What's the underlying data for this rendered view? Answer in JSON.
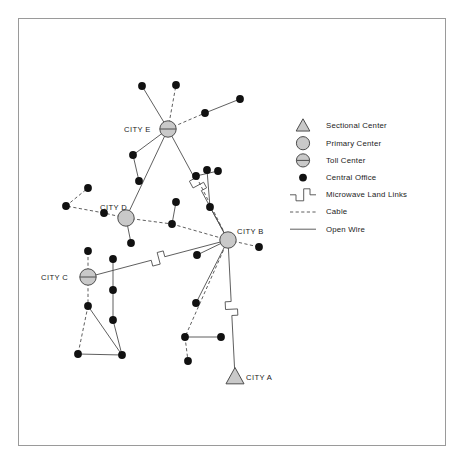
{
  "diagram": {
    "colors": {
      "line": "#4d4d4d",
      "node_fill": "#111111",
      "center_fill": "#c9c9c9",
      "center_stroke": "#4d4d4d",
      "frame": "#9a9a9a",
      "text": "#1a1a1a"
    },
    "cities": [
      {
        "id": "A",
        "label": "CITY A",
        "type": "sectional-center",
        "x": 235,
        "y": 377,
        "label_x": 246,
        "label_y": 373
      },
      {
        "id": "B",
        "label": "CITY B",
        "type": "primary-center",
        "x": 228,
        "y": 240,
        "label_x": 237,
        "label_y": 227
      },
      {
        "id": "C",
        "label": "CITY C",
        "type": "toll-center",
        "x": 88,
        "y": 277,
        "label_x": 41,
        "label_y": 273
      },
      {
        "id": "D",
        "label": "CITY D",
        "type": "primary-center",
        "x": 126,
        "y": 218,
        "label_x": 100,
        "label_y": 203
      },
      {
        "id": "E",
        "label": "CITY E",
        "type": "toll-center",
        "x": 168,
        "y": 129,
        "label_x": 124,
        "label_y": 125
      }
    ],
    "central_offices": [
      {
        "x": 142,
        "y": 86
      },
      {
        "x": 176,
        "y": 85
      },
      {
        "x": 240,
        "y": 99
      },
      {
        "x": 205,
        "y": 113
      },
      {
        "x": 133,
        "y": 155
      },
      {
        "x": 139,
        "y": 181
      },
      {
        "x": 88,
        "y": 188
      },
      {
        "x": 66,
        "y": 206
      },
      {
        "x": 104,
        "y": 213
      },
      {
        "x": 176,
        "y": 202
      },
      {
        "x": 172,
        "y": 224
      },
      {
        "x": 210,
        "y": 207
      },
      {
        "x": 196,
        "y": 176
      },
      {
        "x": 207,
        "y": 170
      },
      {
        "x": 218,
        "y": 171
      },
      {
        "x": 131,
        "y": 243
      },
      {
        "x": 88,
        "y": 251
      },
      {
        "x": 88,
        "y": 306
      },
      {
        "x": 78,
        "y": 354
      },
      {
        "x": 122,
        "y": 355
      },
      {
        "x": 113,
        "y": 259
      },
      {
        "x": 113,
        "y": 290
      },
      {
        "x": 113,
        "y": 320
      },
      {
        "x": 196,
        "y": 303
      },
      {
        "x": 185,
        "y": 337
      },
      {
        "x": 221,
        "y": 337
      },
      {
        "x": 188,
        "y": 361
      },
      {
        "x": 259,
        "y": 247
      },
      {
        "x": 197,
        "y": 255
      }
    ],
    "links": [
      {
        "from": "E",
        "to": "co",
        "kind": "open-wire",
        "x1": 168,
        "y1": 129,
        "x2": 142,
        "y2": 86
      },
      {
        "from": "E",
        "to": "co",
        "kind": "cable",
        "x1": 168,
        "y1": 129,
        "x2": 176,
        "y2": 85
      },
      {
        "from": "E",
        "to": "co",
        "kind": "cable",
        "x1": 168,
        "y1": 129,
        "x2": 205,
        "y2": 113
      },
      {
        "from": "co",
        "to": "co",
        "kind": "open-wire",
        "x1": 205,
        "y1": 113,
        "x2": 240,
        "y2": 99
      },
      {
        "from": "E",
        "to": "co",
        "kind": "open-wire",
        "x1": 168,
        "y1": 129,
        "x2": 133,
        "y2": 155
      },
      {
        "from": "co",
        "to": "co",
        "kind": "open-wire",
        "x1": 133,
        "y1": 155,
        "x2": 139,
        "y2": 181
      },
      {
        "from": "E",
        "to": "B",
        "kind": "microwave",
        "x1": 168,
        "y1": 129,
        "x2": 228,
        "y2": 240
      },
      {
        "from": "D",
        "to": "co",
        "kind": "cable",
        "x1": 126,
        "y1": 218,
        "x2": 104,
        "y2": 213
      },
      {
        "from": "co",
        "to": "co",
        "kind": "cable",
        "x1": 104,
        "y1": 213,
        "x2": 66,
        "y2": 206
      },
      {
        "from": "co",
        "to": "co",
        "kind": "cable",
        "x1": 66,
        "y1": 206,
        "x2": 88,
        "y2": 188
      },
      {
        "from": "D",
        "to": "co",
        "kind": "cable",
        "x1": 126,
        "y1": 218,
        "x2": 172,
        "y2": 224
      },
      {
        "from": "co",
        "to": "co",
        "kind": "open-wire",
        "x1": 172,
        "y1": 224,
        "x2": 176,
        "y2": 202
      },
      {
        "from": "co",
        "to": "B",
        "kind": "cable",
        "x1": 172,
        "y1": 224,
        "x2": 228,
        "y2": 240
      },
      {
        "from": "D",
        "to": "co",
        "kind": "open-wire",
        "x1": 126,
        "y1": 218,
        "x2": 131,
        "y2": 243
      },
      {
        "from": "D",
        "to": "E",
        "kind": "open-wire",
        "x1": 126,
        "y1": 218,
        "x2": 168,
        "y2": 129
      },
      {
        "from": "C",
        "to": "co",
        "kind": "cable",
        "x1": 88,
        "y1": 277,
        "x2": 88,
        "y2": 251
      },
      {
        "from": "C",
        "to": "co",
        "kind": "cable",
        "x1": 88,
        "y1": 277,
        "x2": 88,
        "y2": 306
      },
      {
        "from": "C",
        "to": "B",
        "kind": "microwave",
        "x1": 88,
        "y1": 277,
        "x2": 228,
        "y2": 240
      },
      {
        "from": "co",
        "to": "co",
        "kind": "open-wire",
        "x1": 88,
        "y1": 306,
        "x2": 122,
        "y2": 355
      },
      {
        "from": "co",
        "to": "co",
        "kind": "cable",
        "x1": 88,
        "y1": 306,
        "x2": 78,
        "y2": 354
      },
      {
        "from": "co",
        "to": "co",
        "kind": "open-wire",
        "x1": 78,
        "y1": 354,
        "x2": 122,
        "y2": 355
      },
      {
        "from": "co",
        "to": "co",
        "kind": "open-wire",
        "x1": 113,
        "y1": 259,
        "x2": 113,
        "y2": 290
      },
      {
        "from": "co",
        "to": "co",
        "kind": "open-wire",
        "x1": 113,
        "y1": 290,
        "x2": 113,
        "y2": 320
      },
      {
        "from": "co",
        "to": "co",
        "kind": "open-wire",
        "x1": 113,
        "y1": 320,
        "x2": 122,
        "y2": 355
      },
      {
        "from": "B",
        "to": "co",
        "kind": "open-wire",
        "x1": 228,
        "y1": 240,
        "x2": 210,
        "y2": 207
      },
      {
        "from": "co",
        "to": "co",
        "kind": "open-wire",
        "x1": 210,
        "y1": 207,
        "x2": 207,
        "y2": 170
      },
      {
        "from": "B",
        "to": "cable-west",
        "kind": "cable",
        "x1": 228,
        "y1": 240,
        "x2": 196,
        "y2": 176
      },
      {
        "from": "co",
        "to": "co",
        "kind": "open-wire",
        "x1": 196,
        "y1": 176,
        "x2": 218,
        "y2": 171
      },
      {
        "from": "B",
        "to": "co",
        "kind": "cable",
        "x1": 228,
        "y1": 240,
        "x2": 259,
        "y2": 247
      },
      {
        "from": "B",
        "to": "co",
        "kind": "open-wire",
        "x1": 228,
        "y1": 240,
        "x2": 196,
        "y2": 303
      },
      {
        "from": "B",
        "to": "co",
        "kind": "cable",
        "x1": 228,
        "y1": 240,
        "x2": 185,
        "y2": 337
      },
      {
        "from": "co",
        "to": "co",
        "kind": "cable",
        "x1": 185,
        "y1": 337,
        "x2": 188,
        "y2": 361
      },
      {
        "from": "co",
        "to": "co",
        "kind": "open-wire",
        "x1": 185,
        "y1": 337,
        "x2": 221,
        "y2": 337
      },
      {
        "from": "B",
        "to": "A",
        "kind": "microwave",
        "x1": 228,
        "y1": 240,
        "x2": 235,
        "y2": 377
      },
      {
        "from": "B",
        "to": "co",
        "kind": "open-wire",
        "x1": 228,
        "y1": 240,
        "x2": 197,
        "y2": 255
      }
    ]
  },
  "legend": {
    "items": [
      {
        "symbol": "triangle-icon",
        "label": "Sectional Center"
      },
      {
        "symbol": "circle-icon",
        "label": "Primary Center"
      },
      {
        "symbol": "circle-bar-icon",
        "label": "Toll Center"
      },
      {
        "symbol": "dot-icon",
        "label": "Central Office"
      },
      {
        "symbol": "zigzag-line-icon",
        "label": "Microwave Land Links"
      },
      {
        "symbol": "dashed-line-icon",
        "label": "Cable"
      },
      {
        "symbol": "solid-line-icon",
        "label": "Open Wire"
      }
    ]
  }
}
